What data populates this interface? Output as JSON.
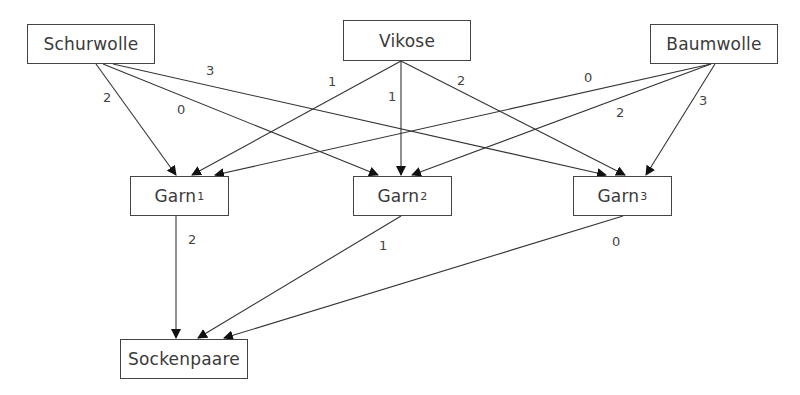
{
  "diagram": {
    "nodes": [
      {
        "id": "schurwolle",
        "label": "Schurwolle",
        "sub": "",
        "x": 27,
        "y": 24,
        "w": 128,
        "h": 40
      },
      {
        "id": "vikose",
        "label": "Vikose",
        "sub": "",
        "x": 343,
        "y": 20,
        "w": 128,
        "h": 41
      },
      {
        "id": "baumwolle",
        "label": "Baumwolle",
        "sub": "",
        "x": 650,
        "y": 24,
        "w": 128,
        "h": 40
      },
      {
        "id": "garn1",
        "label": "Garn",
        "sub": "1",
        "x": 130,
        "y": 176,
        "w": 99,
        "h": 40
      },
      {
        "id": "garn2",
        "label": "Garn",
        "sub": "2",
        "x": 353,
        "y": 176,
        "w": 99,
        "h": 40
      },
      {
        "id": "garn3",
        "label": "Garn",
        "sub": "3",
        "x": 573,
        "y": 176,
        "w": 99,
        "h": 40
      },
      {
        "id": "sockenpaare",
        "label": "Sockenpaare",
        "sub": "",
        "x": 120,
        "y": 339,
        "w": 128,
        "h": 40
      }
    ],
    "edges": [
      {
        "from": "schurwolle",
        "to": "garn1",
        "weight": "2",
        "x1": 96,
        "y1": 64,
        "x2": 176,
        "y2": 175,
        "lx": 103,
        "ly": 90
      },
      {
        "from": "schurwolle",
        "to": "garn2",
        "weight": "0",
        "x1": 103,
        "y1": 64,
        "x2": 378,
        "y2": 175,
        "lx": 177,
        "ly": 102
      },
      {
        "from": "schurwolle",
        "to": "garn3",
        "weight": "3",
        "x1": 113,
        "y1": 64,
        "x2": 606,
        "y2": 175,
        "lx": 206,
        "ly": 63
      },
      {
        "from": "vikose",
        "to": "garn1",
        "weight": "1",
        "x1": 401,
        "y1": 61,
        "x2": 192,
        "y2": 175,
        "lx": 328,
        "ly": 74
      },
      {
        "from": "vikose",
        "to": "garn2",
        "weight": "1",
        "x1": 401,
        "y1": 61,
        "x2": 401,
        "y2": 175,
        "lx": 388,
        "ly": 89
      },
      {
        "from": "vikose",
        "to": "garn3",
        "weight": "2",
        "x1": 401,
        "y1": 61,
        "x2": 625,
        "y2": 175,
        "lx": 457,
        "ly": 73
      },
      {
        "from": "baumwolle",
        "to": "garn1",
        "weight": "0",
        "x1": 711,
        "y1": 64,
        "x2": 215,
        "y2": 175,
        "lx": 584,
        "ly": 70
      },
      {
        "from": "baumwolle",
        "to": "garn2",
        "weight": "2",
        "x1": 711,
        "y1": 64,
        "x2": 412,
        "y2": 175,
        "lx": 616,
        "ly": 105
      },
      {
        "from": "baumwolle",
        "to": "garn3",
        "weight": "3",
        "x1": 715,
        "y1": 64,
        "x2": 646,
        "y2": 175,
        "lx": 699,
        "ly": 93
      },
      {
        "from": "garn1",
        "to": "sockenpaare",
        "weight": "2",
        "x1": 176,
        "y1": 216,
        "x2": 176,
        "y2": 338,
        "lx": 188,
        "ly": 232
      },
      {
        "from": "garn2",
        "to": "sockenpaare",
        "weight": "1",
        "x1": 401,
        "y1": 216,
        "x2": 198,
        "y2": 338,
        "lx": 379,
        "ly": 238
      },
      {
        "from": "garn3",
        "to": "sockenpaare",
        "weight": "0",
        "x1": 623,
        "y1": 216,
        "x2": 224,
        "y2": 338,
        "lx": 612,
        "ly": 234
      }
    ]
  }
}
